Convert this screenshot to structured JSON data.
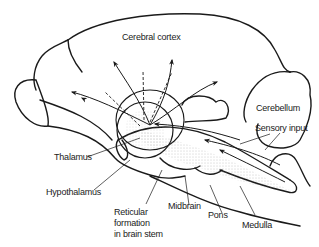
{
  "diagram": {
    "type": "anatomical-illustration",
    "colors": {
      "line": "#1a1a1a",
      "background": "#ffffff",
      "stipple": "#9a9a9a"
    },
    "labels": {
      "cerebral_cortex": "Cerebral cortex",
      "cerebellum": "Cerebellum",
      "sensory_input": "Sensory input",
      "thalamus": "Thalamus",
      "hypothalamus": "Hypothalamus",
      "reticular_line1": "Reticular",
      "reticular_line2": "formation",
      "reticular_line3": "in brain stem",
      "midbrain": "Midbrain",
      "pons": "Pons",
      "medulla": "Medulla"
    }
  }
}
